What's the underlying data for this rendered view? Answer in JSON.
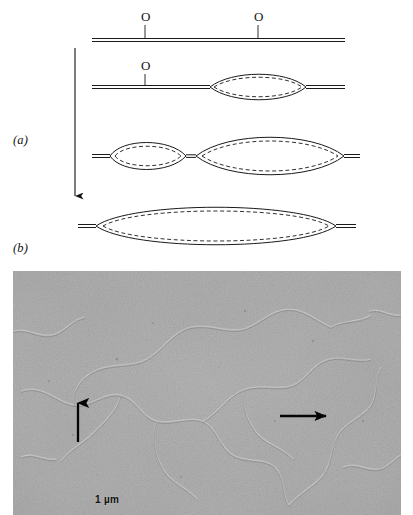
{
  "figure": {
    "panels": [
      {
        "id": "a",
        "label": "(a)",
        "caption_type": "schematic"
      },
      {
        "id": "b",
        "label": "(b)",
        "caption_type": "electron-micrograph"
      }
    ]
  },
  "panel_a": {
    "label": "(a)",
    "time_arrow": {
      "name": "time-arrow",
      "direction": "down"
    },
    "stages": [
      {
        "index": 1,
        "name": "unreplicated-duplex",
        "origins": [
          {
            "label": "O",
            "x": 145
          },
          {
            "label": "O",
            "x": 258
          }
        ],
        "bubbles": []
      },
      {
        "index": 2,
        "name": "single-replication-bubble",
        "origins": [
          {
            "label": "O",
            "x": 145
          }
        ],
        "bubbles": [
          {
            "name": "replication-bubble-right",
            "center_x": 258,
            "half_width": 48,
            "half_height": 15
          }
        ]
      },
      {
        "index": 3,
        "name": "two-replication-bubbles",
        "origins": [],
        "bubbles": [
          {
            "name": "replication-bubble-left",
            "center_x": 148,
            "half_width": 40,
            "half_height": 16
          },
          {
            "name": "replication-bubble-right",
            "center_x": 268,
            "half_width": 78,
            "half_height": 19
          }
        ]
      },
      {
        "index": 4,
        "name": "merged-replication-bubble",
        "origins": [],
        "bubbles": [
          {
            "name": "merged-bubble",
            "center_x": 215,
            "half_width": 125,
            "half_height": 19
          }
        ]
      }
    ],
    "legend_notes": {
      "origin_symbol": "O",
      "solid_line_meaning": "parental DNA strand",
      "dashed_line_meaning": "newly synthesized DNA strand"
    }
  },
  "panel_b": {
    "label": "(b)",
    "scale_bar": {
      "text": "1 µm",
      "name": "scale-bar-label"
    },
    "annotations": [
      {
        "name": "arrow-up-left",
        "direction": "up",
        "x": 78,
        "y_top": 400,
        "y_bottom": 442
      },
      {
        "name": "arrow-right",
        "direction": "right",
        "x_start": 280,
        "x_end": 326,
        "y": 416
      }
    ],
    "image_description": "grainy grayscale electron micrograph of replicating DNA fibers"
  },
  "colors": {
    "ink": "#111111",
    "line": "#1a1a1a",
    "paper": "#ffffff",
    "micrograph_base": "#a9a9a9",
    "micrograph_dark": "#6f6f6f",
    "micrograph_light": "#d8d8d8"
  }
}
